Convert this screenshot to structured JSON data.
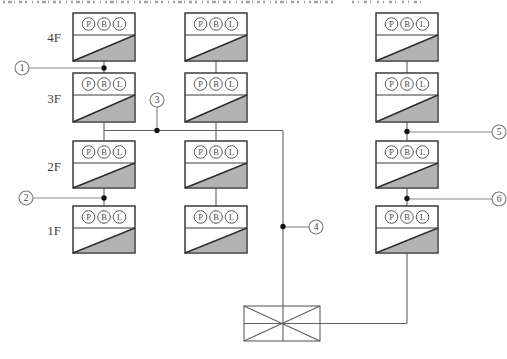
{
  "diagram": {
    "floors": [
      {
        "label": "4F"
      },
      {
        "label": "3F"
      },
      {
        "label": "2F"
      },
      {
        "label": "1F"
      }
    ],
    "panel": {
      "circle_labels": [
        "P",
        "B",
        "L"
      ],
      "count": 12,
      "columns": 3
    },
    "callouts": [
      {
        "number": "1",
        "location": "left column riser between 4F and 3F panels"
      },
      {
        "number": "2",
        "location": "left column riser between 2F and 1F panels"
      },
      {
        "number": "3",
        "location": "horizontal bus between 3F and 2F levels"
      },
      {
        "number": "4",
        "location": "main vertical feeder above transformer"
      },
      {
        "number": "5",
        "location": "right column riser between 3F and 2F panels"
      },
      {
        "number": "6",
        "location": "right column riser between 2F and 1F panels"
      }
    ],
    "transformer": {
      "symbol": "crossed-box"
    }
  },
  "colors": {
    "background": "#ffffff",
    "panel_border": "#3a3a3a",
    "panel_fill_gray": "#b3b3b3",
    "line": "#5f5f5f",
    "leader": "#8c8c8c",
    "dot": "#111111",
    "callout_ring": "#7a7a7a",
    "text": "#3f3f3f"
  }
}
